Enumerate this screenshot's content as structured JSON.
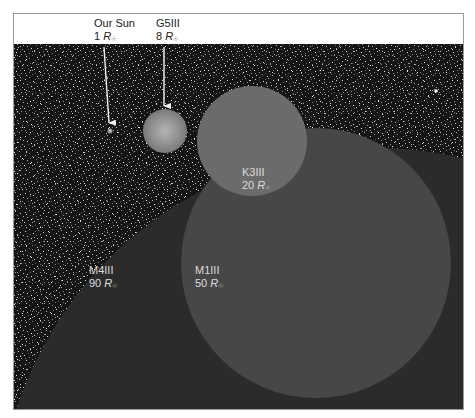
{
  "figure": {
    "unit_symbol": "R",
    "unit_subscript": "☉",
    "colors": {
      "background_space": "#141414",
      "sun": "#9a9a9a",
      "g5iii": "#8c8c8c",
      "k3iii": "#6a6a6a",
      "m1iii": "#4a4a4a",
      "m4iii": "#2b2b2b",
      "label_text_dark": "#222222",
      "label_text_light": "#dcdcdc",
      "arrow": "#f2f2f2"
    }
  },
  "stars": [
    {
      "id": "sun",
      "name": "Our Sun",
      "radius_value": "1",
      "radius_solar": 1,
      "label_position": "top",
      "has_arrow": true
    },
    {
      "id": "g5iii",
      "name": "G5III",
      "radius_value": "8",
      "radius_solar": 8,
      "label_position": "top",
      "has_arrow": true
    },
    {
      "id": "k3iii",
      "name": "K3III",
      "radius_value": "20",
      "radius_solar": 20,
      "label_position": "inside"
    },
    {
      "id": "m1iii",
      "name": "M1III",
      "radius_value": "50",
      "radius_solar": 50,
      "label_position": "inside"
    },
    {
      "id": "m4iii",
      "name": "M4III",
      "radius_value": "90",
      "radius_solar": 90,
      "label_position": "inside"
    }
  ]
}
